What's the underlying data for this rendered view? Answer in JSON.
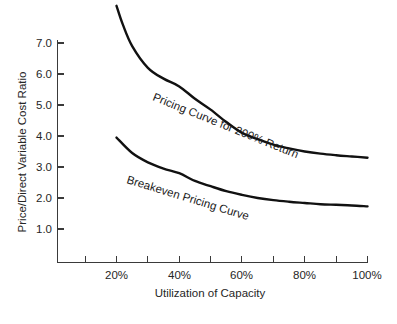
{
  "chart_data": {
    "type": "line",
    "title": "",
    "xlabel": "Utilization of Capacity",
    "ylabel": "Price/Direct Variable Cost Ratio",
    "xlim": [
      0,
      105
    ],
    "ylim": [
      0,
      7.6
    ],
    "grid": false,
    "legend": "inline-curve-labels",
    "x_tick_labels": [
      "20%",
      "40%",
      "60%",
      "80%",
      "100%"
    ],
    "x_tick_values": [
      20,
      40,
      60,
      80,
      100
    ],
    "x_minor_ticks": [
      10,
      30,
      50,
      70,
      90
    ],
    "y_tick_labels": [
      "1.0",
      "2.0",
      "3.0",
      "4.0",
      "5.0",
      "6.0",
      "7.0"
    ],
    "y_tick_values": [
      1.0,
      2.0,
      3.0,
      4.0,
      5.0,
      6.0,
      7.0
    ],
    "series": [
      {
        "name": "Pricing Curve for 200% Return",
        "label": "Pricing Curve for 200% Return",
        "x": [
          20,
          22,
          25,
          30,
          35,
          40,
          45,
          50,
          55,
          60,
          65,
          70,
          75,
          80,
          85,
          90,
          95,
          100
        ],
        "values": [
          8.2,
          7.6,
          6.9,
          6.2,
          5.85,
          5.6,
          5.2,
          4.85,
          4.45,
          4.1,
          3.9,
          3.72,
          3.6,
          3.5,
          3.43,
          3.38,
          3.34,
          3.3
        ]
      },
      {
        "name": "Breakeven Pricing Curve",
        "label": "Breakeven Pricing Curve",
        "x": [
          20,
          25,
          30,
          35,
          40,
          45,
          50,
          55,
          60,
          65,
          70,
          75,
          80,
          85,
          90,
          95,
          100
        ],
        "values": [
          3.95,
          3.45,
          3.15,
          2.95,
          2.8,
          2.55,
          2.38,
          2.22,
          2.1,
          2.0,
          1.93,
          1.88,
          1.84,
          1.8,
          1.78,
          1.76,
          1.73
        ]
      }
    ]
  }
}
